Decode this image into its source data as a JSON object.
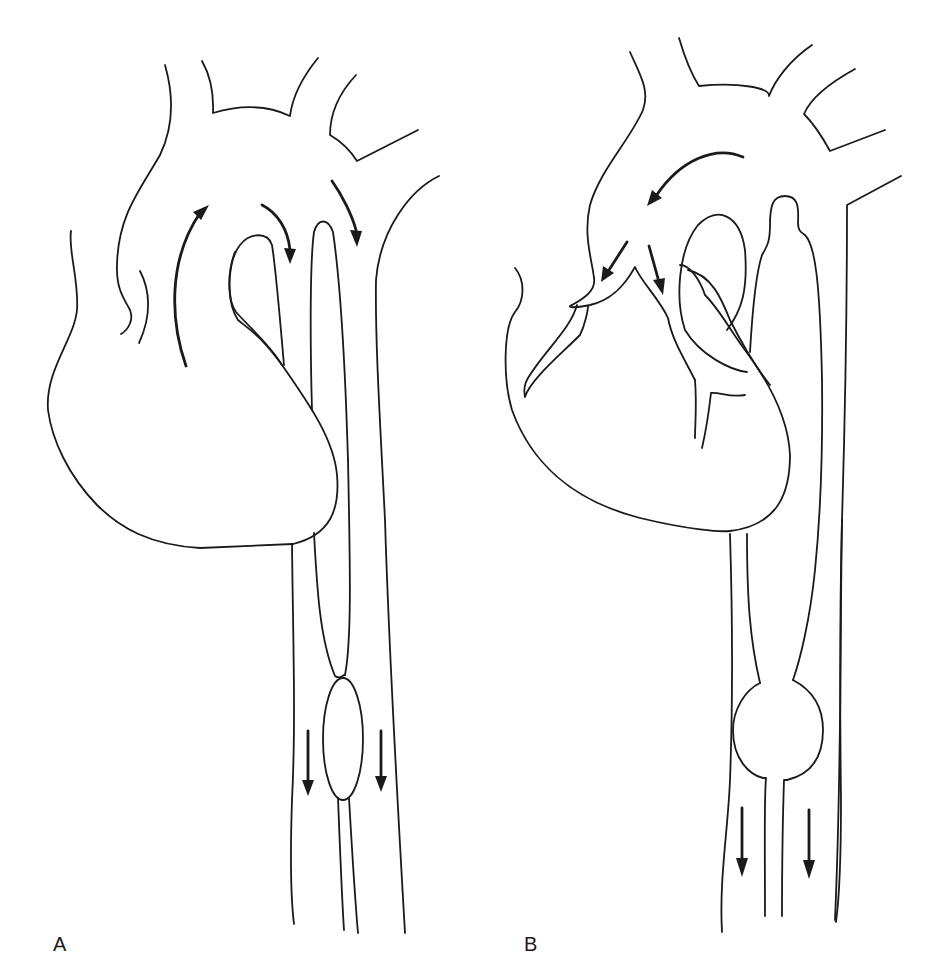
{
  "figure": {
    "type": "anatomical line drawing",
    "stroke_color": "#1a1a1a",
    "background": "#ffffff"
  },
  "panels": [
    {
      "label": "A",
      "flow_arrows": [
        {
          "location": "ascending aorta",
          "direction": "up"
        },
        {
          "location": "aortic arch",
          "direction": "down-right"
        },
        {
          "location": "proximal descending aorta",
          "direction": "down"
        },
        {
          "location": "descending vessel left of constriction",
          "direction": "down"
        },
        {
          "location": "descending vessel right of constriction",
          "direction": "down"
        }
      ],
      "features": [
        "figure-eight constriction with oval dilatation in central vessel"
      ]
    },
    {
      "label": "B",
      "flow_arrows": [
        {
          "location": "aortic arch",
          "direction": "down-left"
        },
        {
          "location": "outflow left branch",
          "direction": "down-left"
        },
        {
          "location": "outflow right branch",
          "direction": "down"
        },
        {
          "location": "descending vessel left of bulge",
          "direction": "down"
        },
        {
          "location": "descending vessel right of bulge",
          "direction": "down"
        }
      ],
      "features": [
        "round aneurysmal dilatation in central vessel"
      ]
    }
  ]
}
